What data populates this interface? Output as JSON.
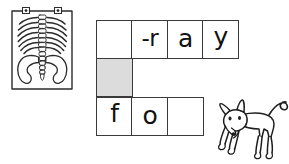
{
  "worksheet": {
    "type": "crossword-word-puzzle",
    "images": [
      {
        "name": "x-ray-image",
        "alt": "x-ray of ribcage spine and pelvis on a lightbox"
      },
      {
        "name": "fox-image",
        "alt": "line drawing of a fox"
      }
    ]
  },
  "grid": {
    "columns": 4,
    "rows": 3,
    "shaded_color": "#dcdcdc",
    "border_color": "#3a3a3a",
    "rows_data": [
      {
        "name": "row-1",
        "cells": [
          {
            "letter": "",
            "shaded": false
          },
          {
            "letter": "-r",
            "shaded": false
          },
          {
            "letter": "a",
            "shaded": false
          },
          {
            "letter": "y",
            "shaded": false
          }
        ]
      },
      {
        "name": "row-2",
        "cells": [
          {
            "letter": "",
            "shaded": true
          }
        ]
      },
      {
        "name": "row-3",
        "cells": [
          {
            "letter": "f",
            "shaded": false
          },
          {
            "letter": "o",
            "shaded": false
          },
          {
            "letter": "",
            "shaded": false
          }
        ]
      }
    ]
  }
}
